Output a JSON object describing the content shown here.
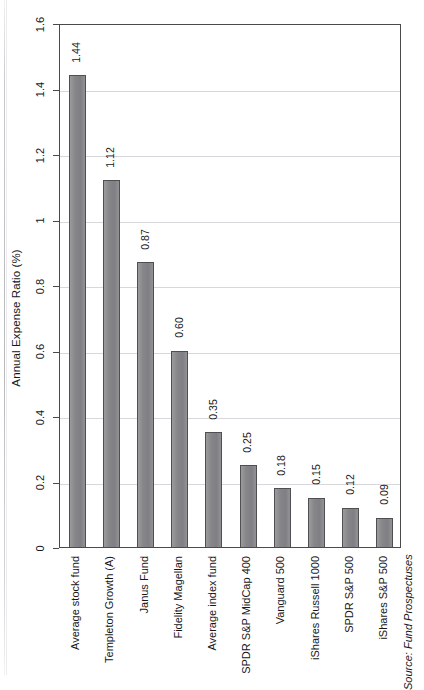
{
  "chart_data": {
    "type": "bar",
    "title": "",
    "xlabel": "",
    "ylabel": "Annual Expense Ratio (%)",
    "ylim": [
      0,
      1.6
    ],
    "ytick_labels": [
      "0",
      "0.2",
      "0.4",
      "0.6",
      "0.8",
      "1",
      "1.2",
      "1.4",
      "1.6"
    ],
    "ytick_values": [
      0,
      0.2,
      0.4,
      0.6,
      0.8,
      1,
      1.2,
      1.4,
      1.6
    ],
    "grid": "horizontal",
    "legend": "none",
    "orientation": "vertical",
    "bar_color": "#8a8a8c",
    "bar_border_color": "#4f4f52",
    "gridline_color": "#d8d8dc",
    "axis_color": "#4a4a4d",
    "categories": [
      "Average stock fund",
      "Templeton Growth (A)",
      "Janus Fund",
      "Fidelity Magellan",
      "Average index fund",
      "SPDR S&P MidCap 400",
      "Vanguard 500",
      "iShares Russell 1000",
      "SPDR S&P 500",
      "iShares S&P 500"
    ],
    "values": [
      1.44,
      1.12,
      0.87,
      0.6,
      0.35,
      0.25,
      0.18,
      0.15,
      0.12,
      0.09
    ],
    "value_labels": [
      "1.44",
      "1.12",
      "0.87",
      "0.60",
      "0.35",
      "0.25",
      "0.18",
      "0.15",
      "0.12",
      "0.09"
    ],
    "annotations": [
      "Source: Fund Prospectuses"
    ]
  },
  "figure": {
    "y_axis_title": "Annual Expense Ratio (%)",
    "source_note": "Source: Fund Prospectuses"
  }
}
